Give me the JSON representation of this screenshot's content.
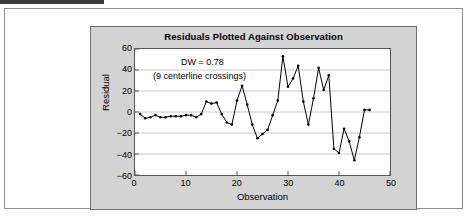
{
  "figure": {
    "title": "Residuals Plotted Against Observation"
  },
  "annotations": {
    "dw": "DW = 0.78",
    "crossings": "(9 centerline crossings)"
  },
  "axes": {
    "x_label": "Observation",
    "y_label": "Residual",
    "x_ticks": [
      "0",
      "10",
      "20",
      "30",
      "40",
      "50"
    ],
    "y_ticks": [
      "60",
      "40",
      "20",
      "0",
      "−20",
      "−40",
      "−60"
    ]
  },
  "colors": {
    "panel": "#d3d3d3",
    "plot_background": "#ffffff",
    "series": "#000000",
    "gridline": "#c8c8c8",
    "frame": "#555555"
  },
  "chart_data": {
    "type": "line",
    "title": "Residuals Plotted Against Observation",
    "xlabel": "Observation",
    "ylabel": "Residual",
    "xlim": [
      0,
      50
    ],
    "ylim": [
      -60,
      60
    ],
    "xticks": [
      0,
      10,
      20,
      30,
      40,
      50
    ],
    "yticks": [
      -60,
      -40,
      -20,
      0,
      20,
      40,
      60
    ],
    "grid": "horizontal",
    "legend": "none",
    "markers": true,
    "annotations": [
      "DW = 0.78",
      "(9 centerline crossings)"
    ],
    "series": [
      {
        "name": "Residual",
        "x": [
          1,
          2,
          3,
          4,
          5,
          6,
          7,
          8,
          9,
          10,
          11,
          12,
          13,
          14,
          15,
          16,
          17,
          18,
          19,
          20,
          21,
          22,
          23,
          24,
          25,
          26,
          27,
          28,
          29,
          30,
          31,
          32,
          33,
          34,
          35,
          36,
          37,
          38,
          39,
          40,
          41,
          42,
          43,
          44,
          45,
          46
        ],
        "y": [
          -2,
          -6,
          -5,
          -3,
          -5,
          -5,
          -4,
          -4,
          -4,
          -3,
          -3,
          -5,
          -2,
          10,
          8,
          9,
          -2,
          -10,
          -12,
          11,
          25,
          7,
          -12,
          -25,
          -21,
          -17,
          -3,
          11,
          53,
          24,
          32,
          44,
          10,
          -12,
          13,
          42,
          21,
          35,
          -35,
          -39,
          -16,
          -28,
          -46,
          -24,
          2,
          2
        ]
      }
    ]
  }
}
